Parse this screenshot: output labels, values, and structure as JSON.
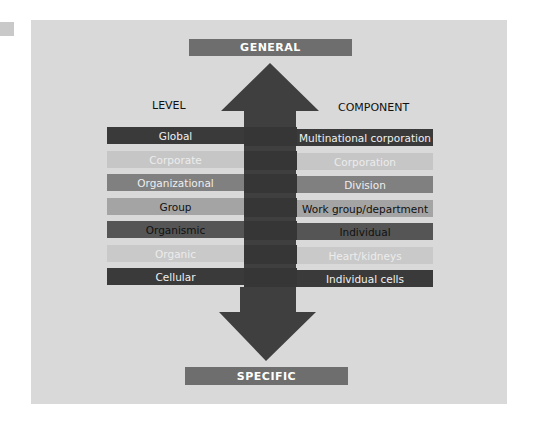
{
  "diagram": {
    "top_label": "GENERAL",
    "bottom_label": "SPECIFIC",
    "left_header": "LEVEL",
    "right_header": "COMPONENT",
    "colors": {
      "panel": "#d9d9d9",
      "arrow": "#3f3f3f",
      "banner": "#6e6e6e"
    },
    "rows": [
      {
        "level": "Global",
        "component": "Multinational corporation",
        "bg": "#3a3a3a",
        "fg": "#f0f0f0"
      },
      {
        "level": "Corporate",
        "component": "Corporation",
        "bg": "#c6c6c6",
        "fg": "#ececec"
      },
      {
        "level": "Organizational",
        "component": "Division",
        "bg": "#808080",
        "fg": "#eeeeee"
      },
      {
        "level": "Group",
        "component": "Work group/department",
        "bg": "#a4a4a4",
        "fg": "#111111"
      },
      {
        "level": "Organismic",
        "component": "Individual",
        "bg": "#555555",
        "fg": "#111111"
      },
      {
        "level": "Organic",
        "component": "Heart/kidneys",
        "bg": "#c9c9c9",
        "fg": "#ececec"
      },
      {
        "level": "Cellular",
        "component": "Individual cells",
        "bg": "#3a3a3a",
        "fg": "#f0f0f0"
      }
    ]
  }
}
